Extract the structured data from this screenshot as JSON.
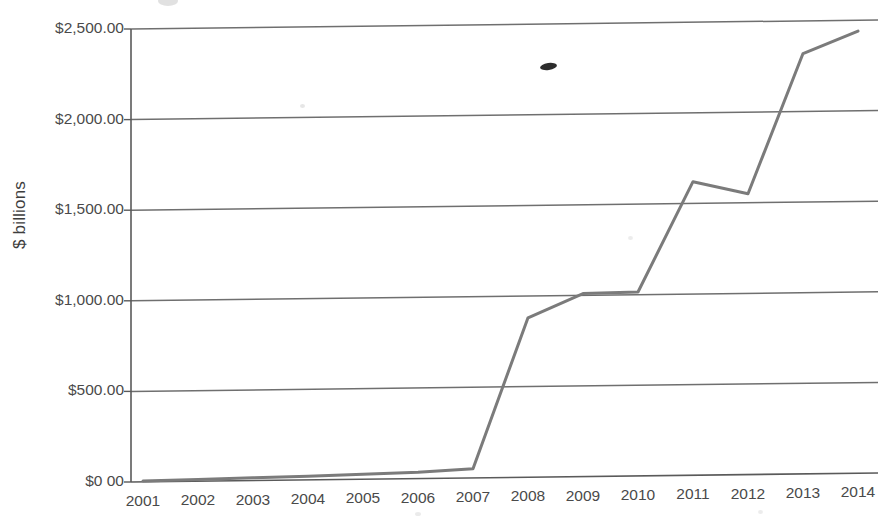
{
  "chart_data": {
    "type": "line",
    "title": "",
    "subtitle": "",
    "xlabel": "",
    "ylabel": "$ billions",
    "categories": [
      "2001",
      "2002",
      "2003",
      "2004",
      "2005",
      "2006",
      "2007",
      "2008",
      "2009",
      "2010",
      "2011",
      "2012",
      "2013",
      "2014"
    ],
    "values": [
      5,
      10,
      15,
      20,
      28,
      35,
      50,
      880,
      1010,
      1015,
      1620,
      1550,
      2320,
      2440
    ],
    "series": [
      {
        "name": "",
        "values": [
          5,
          10,
          15,
          20,
          28,
          35,
          50,
          880,
          1010,
          1015,
          1620,
          1550,
          2320,
          2440
        ]
      }
    ],
    "ylim": [
      0,
      2500
    ],
    "ytick_values": [
      0,
      500,
      1000,
      1500,
      2000,
      2500
    ],
    "ytick_labels": [
      "$0 00",
      "$500.00",
      "$1,000.00",
      "$1,500.00",
      "$2,000.00",
      "$2,500.00"
    ],
    "grid": true,
    "grid_axis": "y",
    "legend": "none",
    "line_color": "#7b7b7b",
    "grid_color": "#6f6f6f",
    "axis_color": "#5a5a5a",
    "background_color": "#ffffff"
  },
  "axes": {
    "y_title": "$ billions"
  },
  "icons": {
    "smudge": "ink-smudge-artifact",
    "speck": "scan-speck-artifact"
  }
}
